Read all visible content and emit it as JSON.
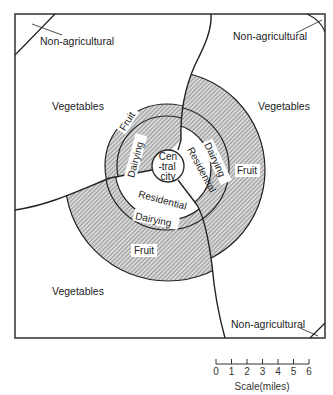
{
  "diagram": {
    "zones": {
      "center": [
        "Cen",
        "-tral",
        "city"
      ],
      "residential": "Residential",
      "dairying": "Dairying",
      "fruit": "Fruit",
      "vegetables": "Vegetables",
      "non_agricultural": "Non-agricultural"
    },
    "labels": {
      "nonag_tl": "Non-agricultural",
      "nonag_tr": "Non-agricultural",
      "nonag_br": "Non-agricultural",
      "veg_left_top": "Vegetables",
      "veg_right": "Vegetables",
      "veg_bottom": "Vegetables",
      "fruit_ul": "Fruit",
      "fruit_right": "Fruit",
      "fruit_bottom": "Fruit",
      "dairy_ul": "Dairying",
      "dairy_right": "Dairying",
      "dairy_bottom": "Dairying",
      "res_right": "Residential",
      "res_bottom": "Residential",
      "city_1": "Cen",
      "city_2": "-tral",
      "city_3": "city"
    },
    "scale": {
      "title": "Scale(miles)",
      "ticks": [
        "0",
        "1",
        "2",
        "3",
        "4",
        "5",
        "6"
      ]
    },
    "colors": {
      "line": "#222222",
      "hatch": "#555555",
      "background": "#ffffff"
    }
  }
}
